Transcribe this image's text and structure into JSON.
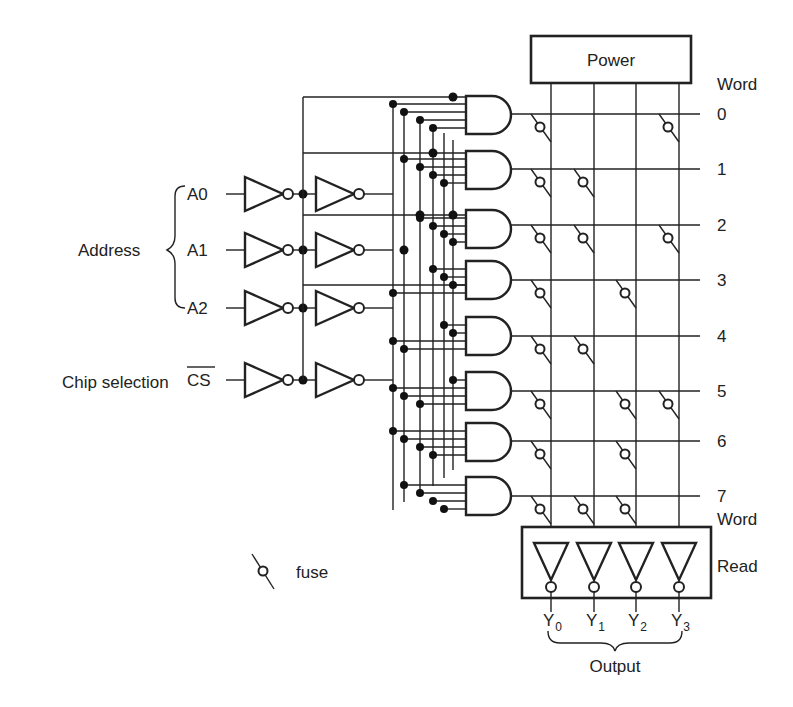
{
  "diagram": {
    "power_label": "Power",
    "word_header_top": "Word",
    "word_header_bottom": "Word",
    "read_label": "Read",
    "output_label": "Output",
    "address_label": "Address",
    "chip_selection_label": "Chip selection",
    "inputs": [
      "A0",
      "A1",
      "A2",
      "CS"
    ],
    "cs_overbar": true,
    "words": [
      "0",
      "1",
      "2",
      "3",
      "4",
      "5",
      "6",
      "7"
    ],
    "outputs": [
      {
        "name": "Y",
        "sub": "0"
      },
      {
        "name": "Y",
        "sub": "1"
      },
      {
        "name": "Y",
        "sub": "2"
      },
      {
        "name": "Y",
        "sub": "3"
      }
    ],
    "fuses": [
      [
        1,
        0,
        0,
        1
      ],
      [
        1,
        1,
        0,
        0
      ],
      [
        1,
        1,
        0,
        1
      ],
      [
        1,
        0,
        1,
        0
      ],
      [
        1,
        1,
        0,
        0
      ],
      [
        1,
        0,
        1,
        1
      ],
      [
        1,
        0,
        1,
        0
      ],
      [
        1,
        1,
        1,
        0
      ]
    ],
    "legend": {
      "icon": "fuse-icon",
      "label": "fuse"
    }
  }
}
